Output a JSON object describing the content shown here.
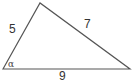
{
  "diagram": {
    "type": "triangle",
    "sides": [
      {
        "id": "left",
        "label": "5"
      },
      {
        "id": "right",
        "label": "7"
      },
      {
        "id": "base",
        "label": "9"
      }
    ],
    "angle_label": "α",
    "stroke_color": "#555555",
    "background": "#ffffff"
  }
}
